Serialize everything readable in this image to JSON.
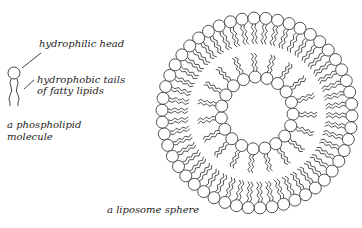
{
  "labels": {
    "head": "hydrophilic head",
    "tails_line1": "hydrophobic tails",
    "tails_line2": "of fatty lipids",
    "molecule_line1": "a phospholipid",
    "molecule_line2": "molecule",
    "sphere": "a liposome sphere"
  },
  "colors": {
    "stroke": "#333333",
    "background": "#ffffff"
  },
  "liposome": {
    "center": [
      257,
      113
    ],
    "outer_head_radius": 95,
    "outer_head_count": 50,
    "inner_head_radius": 36,
    "inner_head_count": 19,
    "head_size": 6
  }
}
